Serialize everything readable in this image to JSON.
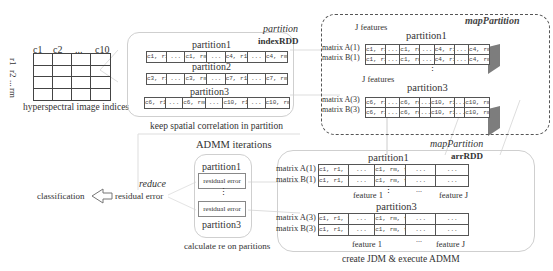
{
  "grid_panel": {
    "col_labels": [
      "c1",
      "c2",
      "...",
      "c10"
    ],
    "row_labels": [
      "r1",
      "r2",
      "...",
      "rm"
    ],
    "caption": "hyperspectral image indices"
  },
  "index_panel": {
    "operation": "partition",
    "rdd_name": "indexRDD",
    "caption": "keep spatial correlation in partition",
    "partitions": [
      {
        "title": "partition1",
        "cells": [
          "c1, r1",
          "...",
          "c1, rm",
          "...",
          "c4, r1",
          "...",
          "c4, rm"
        ]
      },
      {
        "title": "partition2",
        "cells": [
          "c3, r1",
          "...",
          "c3, rm",
          "...",
          "c7, r1",
          "...",
          "c7, rm"
        ]
      },
      {
        "title": "partition3",
        "cells": [
          "c6, r1",
          "...",
          "c6, rm",
          "...",
          "c10, r1",
          "...",
          "c10, rm"
        ]
      }
    ]
  },
  "map_panel": {
    "operation": "mapPartition",
    "groups": [
      {
        "title": "partition1",
        "features_label": "J features",
        "row_labels": [
          "matrix A(1)",
          "matrix B(1)"
        ],
        "cells": [
          "c1, r1",
          "...",
          "c1, rm",
          "...",
          "c4, r1",
          "...",
          "c4, rm"
        ]
      },
      {
        "title": "partition3",
        "features_label": "J features",
        "row_labels": [
          "matrix A(3)",
          "matrix B(3)"
        ],
        "cells": [
          "c6, r1",
          "...",
          "c6, rm",
          "...",
          "c10, r1",
          "...",
          "c10, rm"
        ]
      }
    ],
    "vdots": "⋮"
  },
  "arr_panel": {
    "operation": "mapPartition",
    "rdd_name": "arrRDD",
    "caption": "create JDM & execute ADMM",
    "groups": [
      {
        "title": "partition1",
        "row_labels": [
          "matrix A(1)",
          "matrix B(1)"
        ],
        "cells": [
          "c1, r1, f1",
          "...",
          "c1, rm, f1",
          "...",
          "..."
        ],
        "feature_first": "feature 1",
        "feature_dots": "...",
        "feature_last": "feature J"
      },
      {
        "title": "partition3",
        "row_labels": [
          "matrix A(3)",
          "matrix B(3)"
        ],
        "cells": [
          "c1, r1, f1",
          "...",
          "c1, rm, f1",
          "...",
          "..."
        ],
        "feature_first": "feature 1",
        "feature_dots": "...",
        "feature_last": "feature J"
      }
    ],
    "vdots": "⋮"
  },
  "admm_panel": {
    "title": "ADMM iterations",
    "caption": "calculate re on paritions",
    "partition_top": "partition1",
    "partition_bottom": "partition3",
    "box_label": "residual error",
    "vdots": "⋮"
  },
  "reduce_step": {
    "operation": "reduce",
    "result": "residual error",
    "output": "classification"
  },
  "colors": {
    "line": "#555555",
    "light_line": "#cfcfcf",
    "slab": "#8a8a8a",
    "text": "#333333"
  }
}
